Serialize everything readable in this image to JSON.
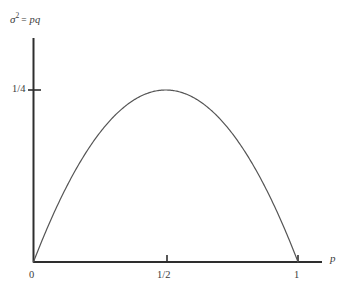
{
  "figure": {
    "background": "#ffffff",
    "ink_color": "#3b3b3b",
    "axis_color": "#2e2e2e",
    "curve_color": "#555555"
  },
  "axes": {
    "y_caption": {
      "symbol": "σ",
      "exponent": "2",
      "equals": "=",
      "expression": "pq"
    },
    "x_caption": "p",
    "y_ticks": [
      {
        "label": "1/4",
        "value": 0.25
      }
    ],
    "x_ticks": [
      {
        "label": "0",
        "value": 0
      },
      {
        "label": "1/2",
        "value": 0.5
      },
      {
        "label": "1",
        "value": 1
      }
    ]
  },
  "chart_data": {
    "type": "line",
    "title": "",
    "subtitle": "",
    "xlabel": "p",
    "ylabel": "σ² = pq",
    "xlim": [
      0,
      1.08
    ],
    "ylim": [
      0,
      0.28
    ],
    "grid": false,
    "legend": null,
    "annotations": [],
    "series": [
      {
        "name": "σ² = pq = p(1 − p)",
        "x": [
          0,
          0.05,
          0.1,
          0.15,
          0.2,
          0.25,
          0.3,
          0.35,
          0.4,
          0.45,
          0.5,
          0.55,
          0.6,
          0.65,
          0.7,
          0.75,
          0.8,
          0.85,
          0.9,
          0.95,
          1
        ],
        "y": [
          0,
          0.0475,
          0.09,
          0.1275,
          0.16,
          0.1875,
          0.21,
          0.2275,
          0.24,
          0.2475,
          0.25,
          0.2475,
          0.24,
          0.2275,
          0.21,
          0.1875,
          0.16,
          0.1275,
          0.09,
          0.0475,
          0
        ]
      }
    ],
    "x_tick_labels": [
      "0",
      "1/2",
      "1"
    ],
    "x_tick_values": [
      0,
      0.5,
      1
    ],
    "y_tick_labels": [
      "1/4"
    ],
    "y_tick_values": [
      0.25
    ],
    "maximum": {
      "x": 0.5,
      "y": 0.25,
      "y_label": "1/4"
    }
  }
}
